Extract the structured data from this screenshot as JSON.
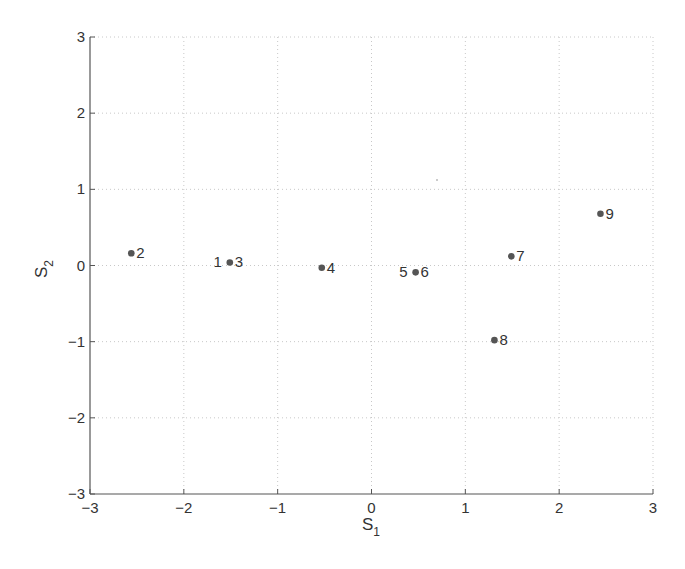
{
  "chart_data": {
    "type": "scatter",
    "title": "",
    "xlabel": "S",
    "xlabel_subscript": "1",
    "ylabel": "S",
    "ylabel_subscript": "2",
    "xlim": [
      -3,
      3
    ],
    "ylim": [
      -3,
      3
    ],
    "xticks": [
      -3,
      -2,
      -1,
      0,
      1,
      2,
      3
    ],
    "yticks": [
      -3,
      -2,
      -1,
      0,
      1,
      2,
      3
    ],
    "grid": true,
    "legend": null,
    "marker_color": "#555555",
    "points": [
      {
        "label": "1",
        "x": -1.51,
        "y": 0.04,
        "label_side": "left"
      },
      {
        "label": "2",
        "x": -2.56,
        "y": 0.16,
        "label_side": "right"
      },
      {
        "label": "3",
        "x": -1.51,
        "y": 0.04,
        "label_side": "right"
      },
      {
        "label": "4",
        "x": -0.53,
        "y": -0.03,
        "label_side": "right"
      },
      {
        "label": "5",
        "x": 0.47,
        "y": -0.09,
        "label_side": "left"
      },
      {
        "label": "6",
        "x": 0.47,
        "y": -0.09,
        "label_side": "right"
      },
      {
        "label": "7",
        "x": 1.49,
        "y": 0.12,
        "label_side": "right"
      },
      {
        "label": "8",
        "x": 1.31,
        "y": -0.98,
        "label_side": "right"
      },
      {
        "label": "9",
        "x": 2.44,
        "y": 0.68,
        "label_side": "right"
      }
    ]
  }
}
